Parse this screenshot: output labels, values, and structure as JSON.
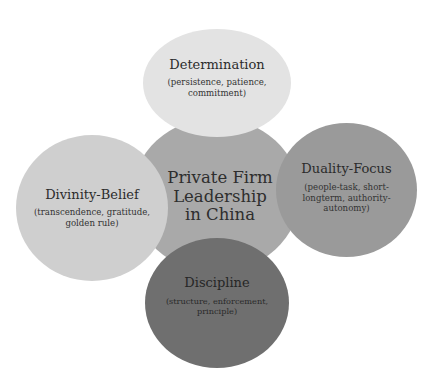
{
  "diagram": {
    "type": "radial-venn",
    "center": {
      "title": "Private Firm Leadership in China",
      "color": "#a9a9a9"
    },
    "nodes": [
      {
        "position": "top",
        "title": "Determination",
        "subtitle": "(persistence, patience, commitment)",
        "color": "#e3e3e3"
      },
      {
        "position": "right",
        "title": "Duality-Focus",
        "subtitle": "(people-task, short-longterm, authority-autonomy)",
        "color": "#9a9a9a"
      },
      {
        "position": "bottom",
        "title": "Discipline",
        "subtitle": "(structure, enforcement, principle)",
        "color": "#6f6f6f"
      },
      {
        "position": "left",
        "title": "Divinity-Belief",
        "subtitle": "(transcendence, gratitude, golden rule)",
        "color": "#cfcfcf"
      }
    ]
  }
}
